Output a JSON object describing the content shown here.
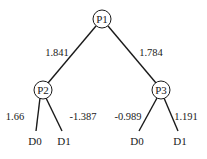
{
  "nodes": {
    "p1": {
      "label": "P1"
    },
    "p2": {
      "label": "P2"
    },
    "p3": {
      "label": "P3"
    },
    "p2_d0": {
      "label": "D0"
    },
    "p2_d1": {
      "label": "D1"
    },
    "p3_d0": {
      "label": "D0"
    },
    "p3_d1": {
      "label": "D1"
    }
  },
  "edges": {
    "p1_p2": {
      "weight": "1.841"
    },
    "p1_p3": {
      "weight": "1.784"
    },
    "p2_d0": {
      "weight": "1.66"
    },
    "p2_d1": {
      "weight": "-1.387"
    },
    "p3_d0": {
      "weight": "-0.989"
    },
    "p3_d1": {
      "weight": "1.191"
    }
  },
  "colors": {
    "line": "#1a1a1a",
    "background": "#ffffff"
  }
}
